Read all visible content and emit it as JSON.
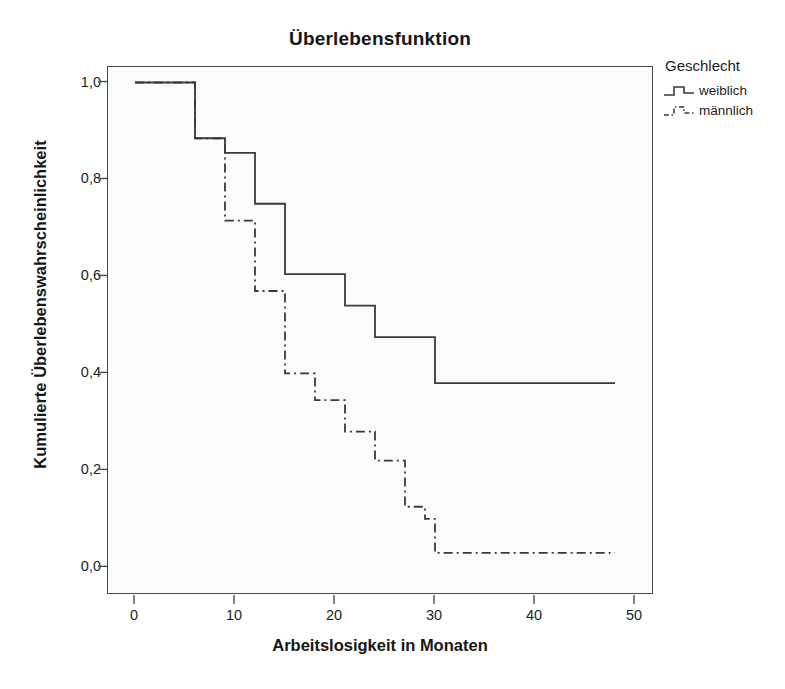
{
  "chart_data": {
    "type": "line",
    "subtype": "kaplan-meier-step",
    "title": "Überlebensfunktion",
    "xlabel": "Arbeitslosigkeit in Monaten",
    "ylabel": "Kumulierte Überlebenswahrscheinlichkeit",
    "xlim": [
      -2.7,
      51.9
    ],
    "ylim": [
      -0.057,
      1.032
    ],
    "xticks": [
      0,
      10,
      20,
      30,
      40,
      50
    ],
    "xticklabels": [
      "0",
      "10",
      "20",
      "30",
      "40",
      "50"
    ],
    "yticks": [
      0.0,
      0.2,
      0.4,
      0.6,
      0.8,
      1.0
    ],
    "yticklabels": [
      "0,0",
      "0,2",
      "0,4",
      "0,6",
      "0,8",
      "1,0"
    ],
    "grid": false,
    "legend": {
      "title": "Geschlecht",
      "position": "right-top",
      "entries": [
        {
          "name": "weiblich",
          "style": "solid",
          "color": "#3a3a3a"
        },
        {
          "name": "männlich",
          "style": "dashdot",
          "color": "#3a3a3a"
        }
      ]
    },
    "series": [
      {
        "name": "weiblich",
        "style": "solid",
        "color": "#3a3a3a",
        "x": [
          0,
          3,
          6,
          9,
          12,
          15,
          18,
          21,
          24,
          30,
          48
        ],
        "y": [
          1.0,
          1.0,
          0.885,
          0.855,
          0.75,
          0.605,
          0.605,
          0.54,
          0.475,
          0.38,
          0.38
        ],
        "points": [
          {
            "t": 0,
            "s": 1.0
          },
          {
            "t": 3,
            "s": 1.0
          },
          {
            "t": 6,
            "s": 0.885
          },
          {
            "t": 9,
            "s": 0.855
          },
          {
            "t": 12,
            "s": 0.75
          },
          {
            "t": 15,
            "s": 0.605
          },
          {
            "t": 21,
            "s": 0.54
          },
          {
            "t": 24,
            "s": 0.475
          },
          {
            "t": 30,
            "s": 0.38
          },
          {
            "t": 48,
            "s": 0.38
          }
        ]
      },
      {
        "name": "männlich",
        "style": "dashdot",
        "color": "#3a3a3a",
        "x": [
          0,
          3,
          6,
          9,
          12,
          15,
          18,
          21,
          24,
          27,
          30,
          48
        ],
        "y": [
          1.0,
          1.0,
          0.885,
          0.715,
          0.57,
          0.4,
          0.345,
          0.28,
          0.22,
          0.125,
          0.1,
          0.03
        ],
        "points": [
          {
            "t": 0,
            "s": 1.0
          },
          {
            "t": 3,
            "s": 1.0
          },
          {
            "t": 6,
            "s": 0.885
          },
          {
            "t": 9,
            "s": 0.715
          },
          {
            "t": 12,
            "s": 0.57
          },
          {
            "t": 15,
            "s": 0.4
          },
          {
            "t": 18,
            "s": 0.345
          },
          {
            "t": 21,
            "s": 0.28
          },
          {
            "t": 24,
            "s": 0.22
          },
          {
            "t": 27,
            "s": 0.125
          },
          {
            "t": 29,
            "s": 0.1
          },
          {
            "t": 30,
            "s": 0.03
          },
          {
            "t": 48,
            "s": 0.03
          }
        ]
      }
    ]
  }
}
